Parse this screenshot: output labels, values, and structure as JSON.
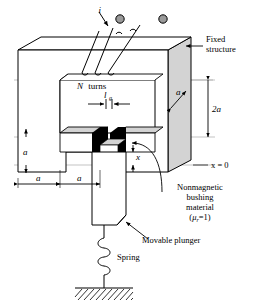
{
  "figure": {
    "kind": "engineering-schematic"
  },
  "labels": {
    "current": "i",
    "turns_count": "N",
    "turns_word": "turns",
    "gap_symbol": "l",
    "gap_subscript": "g",
    "fixed_structure_line1": "Fixed",
    "fixed_structure_line2": "structure",
    "depth_a": "a",
    "height_2a": "2a",
    "left_a": "a",
    "bottom_a_1": "a",
    "bottom_a_2": "a",
    "displacement_x": "x",
    "origin_ref": "x = 0",
    "bushing_line1": "Nonmagnetic",
    "bushing_line2": "bushing",
    "bushing_line3": "material",
    "bushing_mu_open": "(",
    "bushing_mu_symbol": "μ",
    "bushing_mu_sub": "r",
    "bushing_mu_rest": "=1)",
    "movable_plunger": "Movable plunger",
    "spring": "Spring"
  },
  "colors": {
    "stroke": "#000000",
    "background": "#ffffff",
    "face_shade": "#d3d3d3",
    "face_shade_light": "#dcdcdc",
    "bushing_fill": "#000000",
    "terminal_fill": "#9a9a9a",
    "thin_rule": "#9b9b9b"
  },
  "elements": {
    "terminals": 2,
    "coil_wires": 3,
    "spring_coils": 4,
    "ground_hatch_lines": 11
  }
}
